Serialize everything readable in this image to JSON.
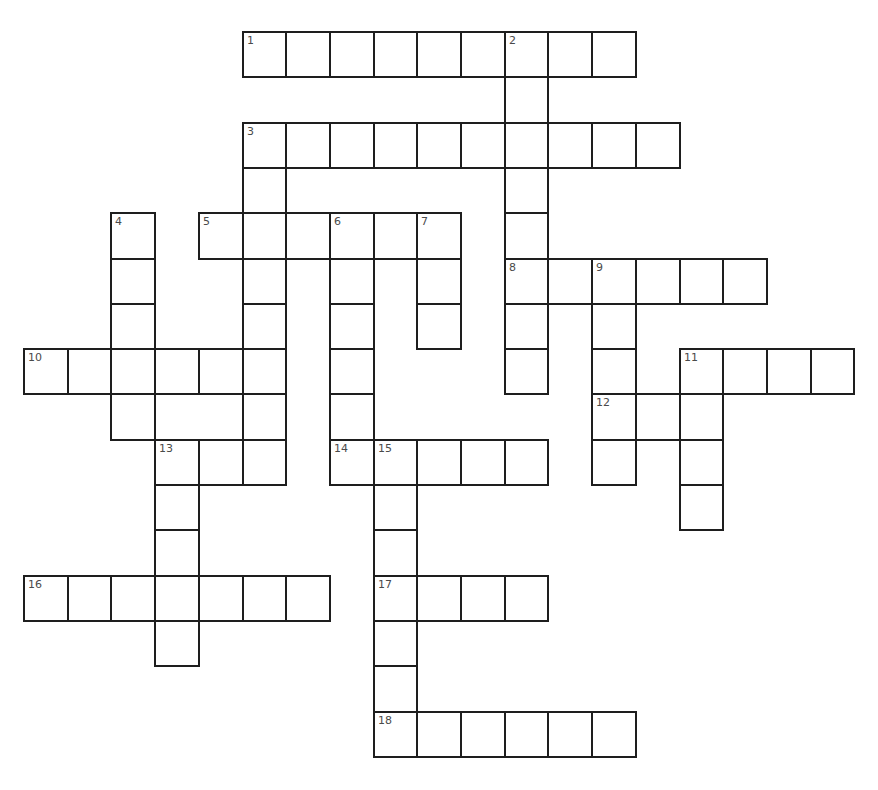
{
  "puzzle": {
    "type": "crossword",
    "grid_origin": {
      "x": 24,
      "y": 32
    },
    "cell_size": {
      "w": 43.7,
      "h": 45.3
    },
    "colors": {
      "border": "#1e1e1e",
      "number": "#4a4a4a",
      "background": "#ffffff"
    },
    "words": [
      {
        "number": 1,
        "direction": "across",
        "row": 0,
        "col": 5,
        "length": 9
      },
      {
        "number": 2,
        "direction": "down",
        "row": 0,
        "col": 11,
        "length": 8
      },
      {
        "number": 3,
        "direction": "across",
        "row": 2,
        "col": 5,
        "length": 10
      },
      {
        "number": 3,
        "direction": "down",
        "row": 2,
        "col": 5,
        "length": 8
      },
      {
        "number": 4,
        "direction": "down",
        "row": 4,
        "col": 2,
        "length": 5
      },
      {
        "number": 5,
        "direction": "across",
        "row": 4,
        "col": 4,
        "length": 6
      },
      {
        "number": 6,
        "direction": "down",
        "row": 4,
        "col": 7,
        "length": 6
      },
      {
        "number": 7,
        "direction": "down",
        "row": 4,
        "col": 9,
        "length": 3
      },
      {
        "number": 8,
        "direction": "across",
        "row": 5,
        "col": 11,
        "length": 6
      },
      {
        "number": 9,
        "direction": "down",
        "row": 5,
        "col": 13,
        "length": 5
      },
      {
        "number": 10,
        "direction": "across",
        "row": 7,
        "col": 0,
        "length": 5
      },
      {
        "number": 11,
        "direction": "across",
        "row": 7,
        "col": 15,
        "length": 4
      },
      {
        "number": 11,
        "direction": "down",
        "row": 7,
        "col": 15,
        "length": 4
      },
      {
        "number": 12,
        "direction": "across",
        "row": 8,
        "col": 13,
        "length": 3
      },
      {
        "number": 13,
        "direction": "across",
        "row": 9,
        "col": 3,
        "length": 3
      },
      {
        "number": 13,
        "direction": "down",
        "row": 9,
        "col": 3,
        "length": 5
      },
      {
        "number": 14,
        "direction": "across",
        "row": 9,
        "col": 7,
        "length": 5
      },
      {
        "number": 15,
        "direction": "down",
        "row": 9,
        "col": 8,
        "length": 7
      },
      {
        "number": 16,
        "direction": "across",
        "row": 12,
        "col": 0,
        "length": 7
      },
      {
        "number": 17,
        "direction": "across",
        "row": 12,
        "col": 8,
        "length": 4
      },
      {
        "number": 18,
        "direction": "across",
        "row": 15,
        "col": 8,
        "length": 6
      }
    ],
    "extra_cells": [
      {
        "row": 8,
        "col": 2
      }
    ]
  }
}
